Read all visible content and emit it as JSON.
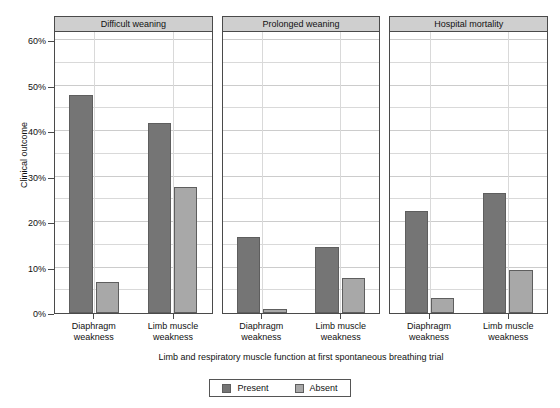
{
  "chart_data": {
    "type": "bar",
    "title": "",
    "subtitle": "",
    "xlabel": "Limb and respiratory muscle function at first spontaneous breathing trial",
    "ylabel": "Clinical outcome",
    "ylim": [
      0,
      62
    ],
    "ytick_values": [
      0,
      10,
      20,
      30,
      40,
      50,
      60
    ],
    "ytick_labels": [
      "0%",
      "10%",
      "20%",
      "30%",
      "40%",
      "50%",
      "60%"
    ],
    "minor_gridline_values": [
      5,
      15,
      25,
      35,
      45,
      55
    ],
    "grid": true,
    "legend_position": "bottom",
    "legend": [
      "Present",
      "Absent"
    ],
    "categories": [
      "Diaphragm weakness",
      "Limb muscle weakness"
    ],
    "panels": [
      {
        "label": "Difficult weaning",
        "groups": [
          {
            "category": "Diaphragm weakness",
            "present": 48.0,
            "absent": 6.9
          },
          {
            "category": "Limb muscle weakness",
            "present": 41.8,
            "absent": 27.8
          }
        ]
      },
      {
        "label": "Prolonged weaning",
        "groups": [
          {
            "category": "Diaphragm weakness",
            "present": 16.7,
            "absent": 0.8
          },
          {
            "category": "Limb muscle weakness",
            "present": 14.5,
            "absent": 7.7
          }
        ]
      },
      {
        "label": "Hospital mortality",
        "groups": [
          {
            "category": "Diaphragm weakness",
            "present": 22.4,
            "absent": 3.4
          },
          {
            "category": "Limb muscle weakness",
            "present": 26.4,
            "absent": 9.5
          }
        ]
      }
    ],
    "colors": {
      "present": "#757575",
      "absent": "#a8a8a8",
      "panel_strip": "#cfcfcf",
      "axis": "#4a4a4a",
      "gridline": "#d9d9d9",
      "background": "#ffffff"
    }
  },
  "axis": {
    "ylabel": "Clinical outcome",
    "xlabel": "Limb and respiratory muscle function at first spontaneous breathing trial"
  },
  "legend": {
    "present_label": "Present",
    "absent_label": "Absent"
  },
  "category_labels": {
    "diaphragm_line1": "Diaphragm",
    "diaphragm_line2": "weakness",
    "limb_line1": "Limb muscle",
    "limb_line2": "weakness"
  }
}
